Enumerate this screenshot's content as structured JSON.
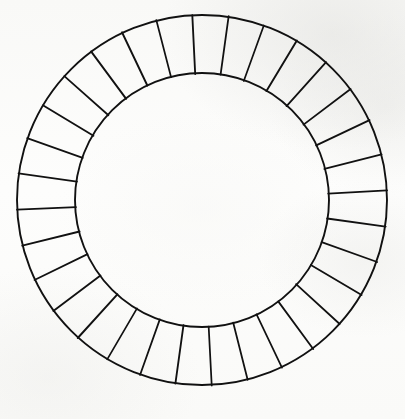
{
  "figure": {
    "title": "Segmented Ring Diagram",
    "canvas": {
      "width": 405,
      "height": 419
    },
    "background_color": "#fdfdfc",
    "ink_color": "#111111"
  },
  "ring": {
    "center_x": 202,
    "center_y": 200,
    "outer_radius": 185,
    "inner_radius": 127,
    "band_thickness": 58,
    "segment_count": 32,
    "segment_angle_degrees": 11.25,
    "start_angle_offset_degrees": -3,
    "outer_stroke_width": 1.9,
    "inner_stroke_width": 1.9,
    "spoke_stroke_width": 1.7,
    "segment_fill": "none",
    "inner_disc_fill": "none"
  },
  "labels": {
    "outer_circle": "outer-circle",
    "inner_circle": "inner-circle",
    "segment": "ring-segment",
    "spoke": "segment-divider"
  },
  "chart_data": {
    "type": "pie",
    "title": "Segmented Ring Diagram",
    "categories": [
      "1",
      "2",
      "3",
      "4",
      "5",
      "6",
      "7",
      "8",
      "9",
      "10",
      "11",
      "12",
      "13",
      "14",
      "15",
      "16",
      "17",
      "18",
      "19",
      "20",
      "21",
      "22",
      "23",
      "24",
      "25",
      "26",
      "27",
      "28",
      "29",
      "30",
      "31",
      "32"
    ],
    "values": [
      1,
      1,
      1,
      1,
      1,
      1,
      1,
      1,
      1,
      1,
      1,
      1,
      1,
      1,
      1,
      1,
      1,
      1,
      1,
      1,
      1,
      1,
      1,
      1,
      1,
      1,
      1,
      1,
      1,
      1,
      1,
      1
    ],
    "xlabel": "",
    "ylabel": "",
    "legend": [],
    "annotations": [],
    "grid": false,
    "donut_inner_ratio": 0.686,
    "all_slices_equal": true,
    "slice_labels_visible": false
  }
}
